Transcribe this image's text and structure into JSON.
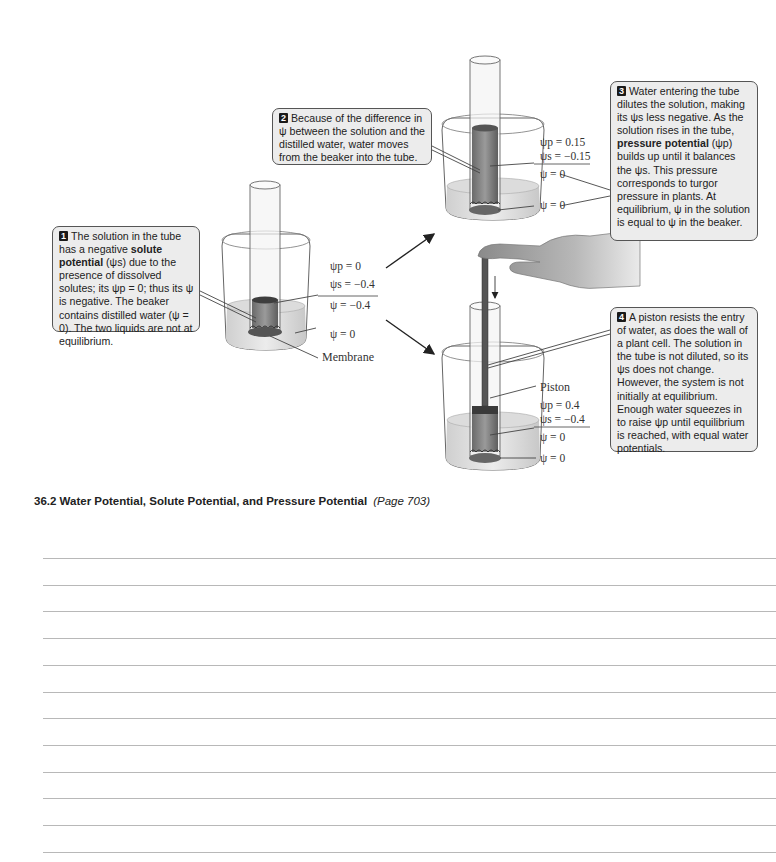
{
  "callouts": [
    {
      "num": "1",
      "pre": "The solution in the tube has a negative ",
      "bold": "solute potential",
      "post": " (ψs) due to the presence of dissolved solutes; its ψp = 0; thus its ψ is negative. The beaker contains distilled water (ψ = 0). The two liquids are not at equilibrium."
    },
    {
      "num": "2",
      "text": "Because of the difference in ψ between the solution and the distilled water, water moves from the beaker into the tube."
    },
    {
      "num": "3",
      "pre": "Water entering the tube dilutes the solution, making its ψs less negative. As the solution rises in the tube, ",
      "bold": "pressure potential",
      "post": " (ψp) builds up until it balances the ψs. This pressure corresponds to turgor pressure in plants. At equilibrium, ψ in the solution is equal to ψ in the beaker."
    },
    {
      "num": "4",
      "text": "A piston resists the entry of water, as does the wall of a plant cell. The solution in the tube is not diluted, so its ψs does not change. However, the system is not initially at equilibrium. Enough water squeezes in to raise ψp until equilibrium is reached, with equal water potentials."
    }
  ],
  "setups": {
    "initial": {
      "psi_p": "ψp =  0",
      "psi_s": "ψs = −0.4",
      "psi": "ψ  = −0.4",
      "beaker_psi": "ψ  =  0",
      "membrane_label": "Membrane"
    },
    "open_tube": {
      "psi_p": "ψp =  0.15",
      "psi_s": "ψs = −0.15",
      "psi": "ψ  =  0",
      "beaker_psi": "ψ  =  0"
    },
    "piston": {
      "piston_label": "Piston",
      "psi_p": "ψp =  0.4",
      "psi_s": "ψs = −0.4",
      "psi": "ψ  =  0",
      "beaker_psi": "ψ  =  0"
    }
  },
  "section": {
    "title": "36.2  Water Potential, Solute Potential, and Pressure Potential",
    "page_ref": "(Page 703)"
  },
  "note_lines": 12
}
